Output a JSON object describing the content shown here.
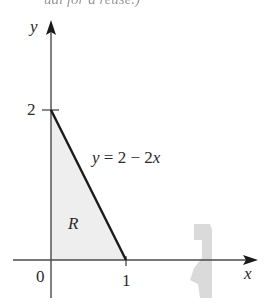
{
  "caption": {
    "cropped_text": "ual for a reuse.)"
  },
  "figure": {
    "axes": {
      "x_label": "x",
      "y_label": "y"
    },
    "ticks": {
      "origin": "0",
      "x_tick": "1",
      "y_tick": "2"
    },
    "line": {
      "equation": "y = 2 − 2x",
      "y_var": "y",
      "rhs": "= 2 − 2",
      "x_var": "x"
    },
    "region": {
      "label": "R",
      "fill_color": "#eeeeee"
    },
    "colors": {
      "axis": "#4a4a4a",
      "line": "#1a1a1a",
      "artifact": "#d6d6d6"
    }
  }
}
